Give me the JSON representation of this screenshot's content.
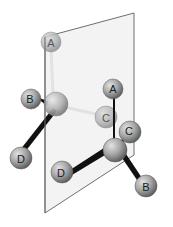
{
  "diagram": {
    "plane": {
      "points": [
        [
          45,
          37
        ],
        [
          134,
          13
        ],
        [
          134,
          155
        ],
        [
          45,
          213
        ]
      ],
      "fill": "#f1f2f1",
      "stroke": "#6f6f6f"
    },
    "left_molecule": {
      "center": {
        "x": 56,
        "y": 104,
        "r": 12
      },
      "atoms": [
        {
          "label": "A",
          "x": 51,
          "y": 42,
          "r": 10
        },
        {
          "label": "B",
          "x": 31,
          "y": 99,
          "r": 10
        },
        {
          "label": "C",
          "x": 106,
          "y": 117,
          "r": 11
        },
        {
          "label": "D",
          "x": 21,
          "y": 158,
          "r": 11
        }
      ]
    },
    "right_molecule": {
      "center": {
        "x": 115,
        "y": 150,
        "r": 12
      },
      "atoms": [
        {
          "label": "A",
          "x": 113,
          "y": 89,
          "r": 10
        },
        {
          "label": "C",
          "x": 130,
          "y": 132,
          "r": 11
        },
        {
          "label": "D",
          "x": 62,
          "y": 172,
          "r": 11
        },
        {
          "label": "B",
          "x": 146,
          "y": 186,
          "r": 11
        }
      ]
    },
    "colors": {
      "atom_dark": "#7b7b7b",
      "atom_light": "#c7c7c7",
      "atom_behind": "#aaaaaa",
      "bond_front": "#111111",
      "bond_back": "#8c8c8c",
      "label": "#1a1a1a"
    }
  }
}
